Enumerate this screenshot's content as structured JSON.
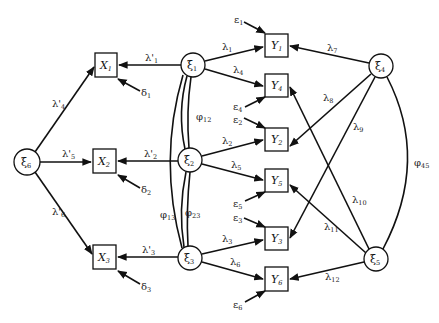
{
  "diagram": {
    "type": "structural-equation-path-diagram",
    "latent_nodes": [
      {
        "id": "xi1",
        "label": "ξ",
        "sub": "1",
        "cx": 193,
        "cy": 65
      },
      {
        "id": "xi2",
        "label": "ξ",
        "sub": "2",
        "cx": 190,
        "cy": 160
      },
      {
        "id": "xi3",
        "label": "ξ",
        "sub": "3",
        "cx": 190,
        "cy": 258
      },
      {
        "id": "xi4",
        "label": "ξ",
        "sub": "4",
        "cx": 381,
        "cy": 66
      },
      {
        "id": "xi5",
        "label": "ξ",
        "sub": "5",
        "cx": 376,
        "cy": 259
      },
      {
        "id": "xi6",
        "label": "ξ",
        "sub": "6",
        "cx": 27,
        "cy": 162
      }
    ],
    "observed_x": [
      {
        "id": "X1",
        "label": "X",
        "sub": "1"
      },
      {
        "id": "X2",
        "label": "X",
        "sub": "2"
      },
      {
        "id": "X3",
        "label": "X",
        "sub": "3"
      }
    ],
    "observed_y": [
      {
        "id": "Y1",
        "label": "Y",
        "sub": "1"
      },
      {
        "id": "Y4",
        "label": "Y",
        "sub": "4"
      },
      {
        "id": "Y2",
        "label": "Y",
        "sub": "2"
      },
      {
        "id": "Y5",
        "label": "Y",
        "sub": "5"
      },
      {
        "id": "Y3",
        "label": "Y",
        "sub": "3"
      },
      {
        "id": "Y6",
        "label": "Y",
        "sub": "6"
      }
    ],
    "x_loadings": [
      {
        "from": "xi1",
        "to": "X1",
        "label": "λ'",
        "sub": "1"
      },
      {
        "from": "xi2",
        "to": "X2",
        "label": "λ'",
        "sub": "2"
      },
      {
        "from": "xi3",
        "to": "X3",
        "label": "λ'",
        "sub": "3"
      },
      {
        "from": "xi6",
        "to": "X1",
        "label": "λ'",
        "sub": "4"
      },
      {
        "from": "xi6",
        "to": "X2",
        "label": "λ'",
        "sub": "5"
      },
      {
        "from": "xi6",
        "to": "X3",
        "label": "λ'",
        "sub": "6"
      }
    ],
    "y_loadings": [
      {
        "from": "xi1",
        "to": "Y1",
        "label": "λ",
        "sub": "1"
      },
      {
        "from": "xi1",
        "to": "Y4",
        "label": "λ",
        "sub": "4"
      },
      {
        "from": "xi2",
        "to": "Y2",
        "label": "λ",
        "sub": "2"
      },
      {
        "from": "xi2",
        "to": "Y5",
        "label": "λ",
        "sub": "5"
      },
      {
        "from": "xi3",
        "to": "Y3",
        "label": "λ",
        "sub": "3"
      },
      {
        "from": "xi3",
        "to": "Y6",
        "label": "λ",
        "sub": "6"
      },
      {
        "from": "xi4",
        "to": "Y1",
        "label": "λ",
        "sub": "7"
      },
      {
        "from": "xi4",
        "to": "Y2",
        "label": "λ",
        "sub": "8"
      },
      {
        "from": "xi4",
        "to": "Y3",
        "label": "λ",
        "sub": "9"
      },
      {
        "from": "xi5",
        "to": "Y4",
        "label": "λ",
        "sub": "10"
      },
      {
        "from": "xi5",
        "to": "Y5",
        "label": "λ",
        "sub": "11"
      },
      {
        "from": "xi5",
        "to": "Y6",
        "label": "λ",
        "sub": "12"
      }
    ],
    "covariances": [
      {
        "between": [
          "xi1",
          "xi2"
        ],
        "label": "φ",
        "sub": "12"
      },
      {
        "between": [
          "xi1",
          "xi3"
        ],
        "label": "φ",
        "sub": "13"
      },
      {
        "between": [
          "xi2",
          "xi3"
        ],
        "label": "φ",
        "sub": "23"
      },
      {
        "between": [
          "xi4",
          "xi5"
        ],
        "label": "φ",
        "sub": "45"
      }
    ],
    "errors_x": [
      {
        "to": "X1",
        "label": "δ",
        "sub": "1"
      },
      {
        "to": "X2",
        "label": "δ",
        "sub": "2"
      },
      {
        "to": "X3",
        "label": "δ",
        "sub": "3"
      }
    ],
    "errors_y": [
      {
        "to": "Y1",
        "label": "ε",
        "sub": "1"
      },
      {
        "to": "Y4",
        "label": "ε",
        "sub": "4"
      },
      {
        "to": "Y2",
        "label": "ε",
        "sub": "2"
      },
      {
        "to": "Y5",
        "label": "ε",
        "sub": "5"
      },
      {
        "to": "Y3",
        "label": "ε",
        "sub": "3"
      },
      {
        "to": "Y6",
        "label": "ε",
        "sub": "6"
      }
    ]
  },
  "labels": {
    "xi": "ξ",
    "X": "X",
    "Y": "Y",
    "lam": "λ",
    "lamp": "λ'",
    "phi": "φ",
    "delta": "δ",
    "eps": "ε",
    "s1": "1",
    "s2": "2",
    "s3": "3",
    "s4": "4",
    "s5": "5",
    "s6": "6",
    "s7": "7",
    "s8": "8",
    "s9": "9",
    "s10": "10",
    "s11": "11",
    "s12": "12",
    "s12p": "12",
    "s13": "13",
    "s23": "23",
    "s45": "45"
  }
}
